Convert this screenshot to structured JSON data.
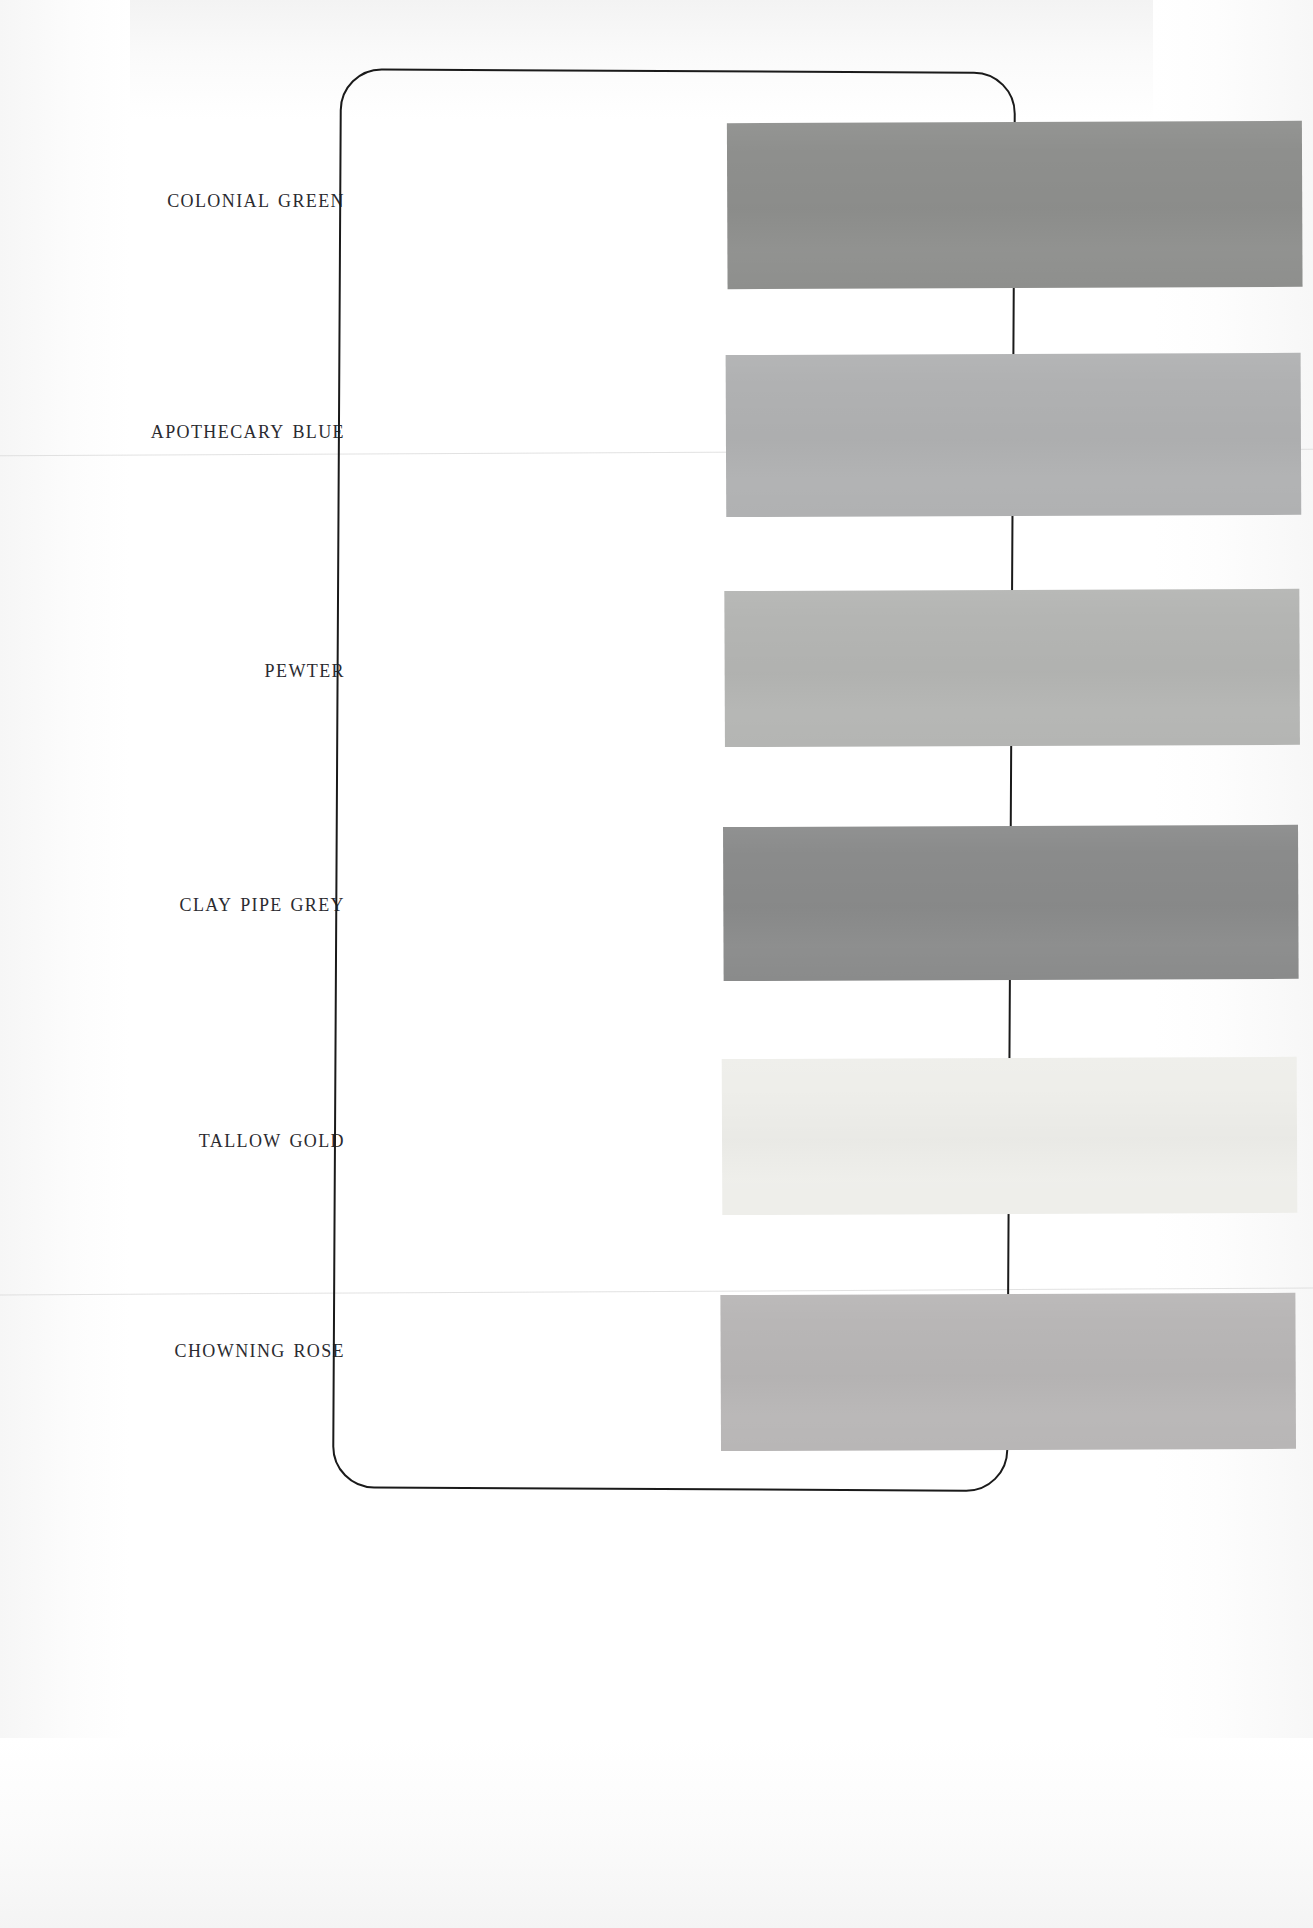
{
  "document": {
    "type": "paint-color-card",
    "medium": "scanned printed card",
    "background_color": "#ffffff",
    "card": {
      "border_color": "#1a1a1a",
      "corner_radius_px": 42,
      "left": 336,
      "top": 70,
      "width": 676,
      "height": 1420
    }
  },
  "swatches": [
    {
      "label": "Colonial Green",
      "color": "#8e8f8d",
      "top": 120,
      "height": 166
    },
    {
      "label": "Apothecary Blue",
      "color": "#b0b1b2",
      "top": 352,
      "height": 162
    },
    {
      "label": "Pewter",
      "color": "#b4b5b3",
      "top": 588,
      "height": 156
    },
    {
      "label": "Clay Pipe Grey",
      "color": "#8a8b8b",
      "top": 824,
      "height": 154
    },
    {
      "label": "Tallow Gold",
      "color": "#eeeeea",
      "top": 1056,
      "height": 156
    },
    {
      "label": "Chowning Rose",
      "color": "#b8b6b6",
      "top": 1292,
      "height": 156
    }
  ],
  "label_positions": [
    {
      "center_y": 198
    },
    {
      "center_y": 429
    },
    {
      "center_y": 668
    },
    {
      "center_y": 902
    },
    {
      "center_y": 1138
    },
    {
      "center_y": 1348
    }
  ]
}
